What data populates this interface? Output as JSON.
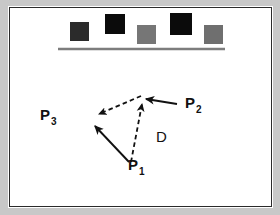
{
  "figure": {
    "background_color": "#c8c8c8",
    "panel_color": "#ffffff",
    "panel_border_color": "#2b2b2b"
  },
  "obstacle_row": {
    "name": "row-of-squares",
    "baseline": {
      "x1": 48,
      "y1": 41,
      "x2": 215,
      "y2": 41,
      "color": "#7d7d7d"
    },
    "squares": [
      {
        "id": "square-1",
        "x": 60,
        "y": 14,
        "size": 19,
        "color": "#2b2b2b"
      },
      {
        "id": "square-2",
        "x": 95,
        "y": 6,
        "size": 20,
        "color": "#0b0b0b"
      },
      {
        "id": "square-3",
        "x": 127,
        "y": 17,
        "size": 19,
        "color": "#767676"
      },
      {
        "id": "square-4",
        "x": 160,
        "y": 5,
        "size": 22,
        "color": "#0b0b0b"
      },
      {
        "id": "square-5",
        "x": 194,
        "y": 17,
        "size": 19,
        "color": "#6f6f6f"
      }
    ]
  },
  "diagram": {
    "points": {
      "p1": {
        "label": "P",
        "sub": "1",
        "x": 118,
        "y": 162
      },
      "p2": {
        "label": "P",
        "sub": "2",
        "x": 175,
        "y": 100
      },
      "p3": {
        "label": "P",
        "sub": "3",
        "x": 30,
        "y": 112
      },
      "d": {
        "label": "D",
        "x": 146,
        "y": 129
      }
    },
    "vertex": {
      "x": 133,
      "y": 92
    },
    "edges": [
      {
        "id": "edge-p1-to-upper-left",
        "style": "solid",
        "from_x": 119,
        "from_y": 154,
        "to_x": 85,
        "to_y": 118,
        "arrow": "end"
      },
      {
        "id": "edge-p2-to-vertex",
        "style": "solid",
        "from_x": 167,
        "from_y": 96,
        "to_x": 136,
        "to_y": 91,
        "arrow": "end"
      },
      {
        "id": "edge-p1-to-vertex",
        "style": "dashed",
        "from_x": 121,
        "from_y": 154,
        "to_x": 132,
        "to_y": 96,
        "arrow": "end"
      },
      {
        "id": "edge-vertex-to-left",
        "style": "dashed",
        "from_x": 131,
        "from_y": 88,
        "to_x": 89,
        "to_y": 106,
        "arrow": "end"
      }
    ]
  }
}
